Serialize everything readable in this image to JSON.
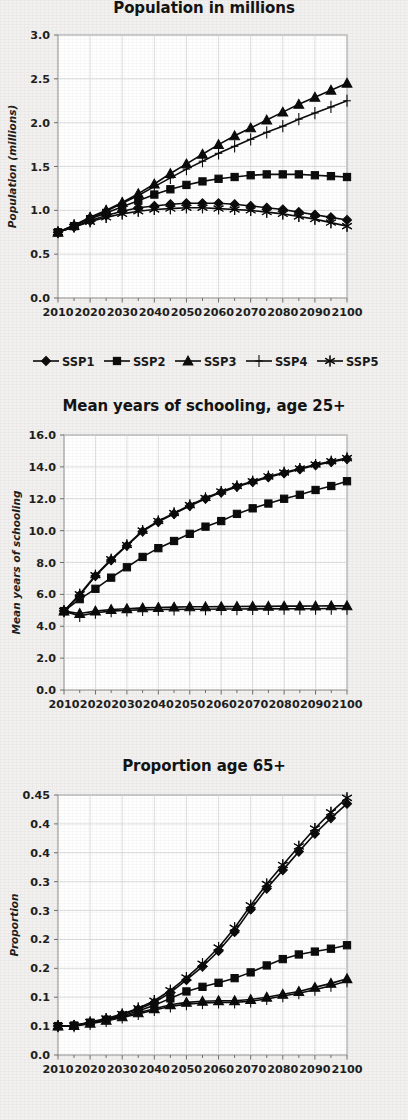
{
  "figure": {
    "background_color": "#f2f1ef",
    "ink_color": "#0c0c0c",
    "grid_color": "#d6d6d6",
    "plot_background": "#ffffff"
  },
  "legend": {
    "position": "below-first-chart",
    "entries": [
      {
        "label": "SSP1",
        "marker": "diamond"
      },
      {
        "label": "SSP2",
        "marker": "square"
      },
      {
        "label": "SSP3",
        "marker": "triangle"
      },
      {
        "label": "SSP4",
        "marker": "plus"
      },
      {
        "label": "SSP5",
        "marker": "asterisk"
      }
    ]
  },
  "chart_data": [
    {
      "type": "line",
      "title": "Population in millions",
      "xlabel": "",
      "ylabel": "Population (millions)",
      "x": [
        2010,
        2015,
        2020,
        2025,
        2030,
        2035,
        2040,
        2045,
        2050,
        2055,
        2060,
        2065,
        2070,
        2075,
        2080,
        2085,
        2090,
        2095,
        2100
      ],
      "xtick_labels": [
        "2010",
        "2020",
        "2030",
        "2040",
        "2050",
        "2060",
        "2070",
        "2080",
        "2090",
        "2100"
      ],
      "xlim": [
        2010,
        2100
      ],
      "ylim": [
        0.0,
        3.0
      ],
      "ytick_labels": [
        "0.0",
        "0.5",
        "1.0",
        "1.5",
        "2.0",
        "2.5",
        "3.0"
      ],
      "ytick_values": [
        0.0,
        0.5,
        1.0,
        1.5,
        2.0,
        2.5,
        3.0
      ],
      "grid": true,
      "legend_position": "bottom",
      "series": [
        {
          "name": "SSP1",
          "marker": "diamond",
          "values": [
            0.75,
            0.81,
            0.88,
            0.94,
            0.99,
            1.03,
            1.05,
            1.07,
            1.08,
            1.08,
            1.08,
            1.07,
            1.05,
            1.03,
            1.01,
            0.98,
            0.95,
            0.92,
            0.89
          ]
        },
        {
          "name": "SSP2",
          "marker": "square",
          "values": [
            0.75,
            0.82,
            0.9,
            0.97,
            1.04,
            1.11,
            1.18,
            1.24,
            1.29,
            1.33,
            1.36,
            1.38,
            1.4,
            1.41,
            1.41,
            1.41,
            1.4,
            1.39,
            1.38
          ]
        },
        {
          "name": "SSP3",
          "marker": "triangle",
          "values": [
            0.75,
            0.83,
            0.92,
            1.0,
            1.09,
            1.19,
            1.3,
            1.42,
            1.53,
            1.64,
            1.75,
            1.85,
            1.94,
            2.03,
            2.12,
            2.21,
            2.29,
            2.37,
            2.45
          ]
        },
        {
          "name": "SSP4",
          "marker": "plus",
          "values": [
            0.75,
            0.83,
            0.91,
            0.99,
            1.08,
            1.17,
            1.27,
            1.37,
            1.47,
            1.56,
            1.65,
            1.73,
            1.81,
            1.89,
            1.96,
            2.04,
            2.11,
            2.18,
            2.25
          ]
        },
        {
          "name": "SSP5",
          "marker": "asterisk",
          "values": [
            0.75,
            0.81,
            0.87,
            0.92,
            0.96,
            0.99,
            1.01,
            1.02,
            1.03,
            1.03,
            1.02,
            1.01,
            1.0,
            0.98,
            0.96,
            0.93,
            0.9,
            0.86,
            0.82
          ]
        }
      ]
    },
    {
      "type": "line",
      "title": "Mean years of schooling, age 25+",
      "xlabel": "",
      "ylabel": "Mean years of schooling",
      "x": [
        2010,
        2015,
        2020,
        2025,
        2030,
        2035,
        2040,
        2045,
        2050,
        2055,
        2060,
        2065,
        2070,
        2075,
        2080,
        2085,
        2090,
        2095,
        2100
      ],
      "xtick_labels": [
        "2010",
        "2020",
        "2030",
        "2040",
        "2050",
        "2060",
        "2070",
        "2080",
        "2090",
        "2100"
      ],
      "xlim": [
        2010,
        2100
      ],
      "ylim": [
        0.0,
        16.0
      ],
      "ytick_labels": [
        "0.0",
        "2.0",
        "4.0",
        "6.0",
        "8.0",
        "10.0",
        "12.0",
        "14.0",
        "16.0"
      ],
      "ytick_values": [
        0,
        2,
        4,
        6,
        8,
        10,
        12,
        14,
        16
      ],
      "grid": true,
      "series": [
        {
          "name": "SSP1",
          "marker": "diamond",
          "values": [
            4.95,
            5.95,
            7.15,
            8.15,
            9.05,
            9.95,
            10.55,
            11.05,
            11.55,
            12.0,
            12.4,
            12.75,
            13.05,
            13.35,
            13.6,
            13.85,
            14.1,
            14.3,
            14.5
          ]
        },
        {
          "name": "SSP2",
          "marker": "square",
          "values": [
            4.95,
            5.7,
            6.35,
            7.05,
            7.7,
            8.35,
            8.9,
            9.35,
            9.8,
            10.25,
            10.6,
            11.05,
            11.4,
            11.7,
            12.0,
            12.25,
            12.55,
            12.8,
            13.1
          ]
        },
        {
          "name": "SSP3",
          "marker": "triangle",
          "values": [
            4.95,
            4.8,
            4.95,
            5.05,
            5.1,
            5.15,
            5.18,
            5.2,
            5.22,
            5.22,
            5.23,
            5.24,
            5.25,
            5.25,
            5.26,
            5.26,
            5.27,
            5.28,
            5.28
          ]
        },
        {
          "name": "SSP4",
          "marker": "plus",
          "values": [
            4.95,
            4.65,
            4.85,
            4.95,
            5.0,
            5.03,
            5.05,
            5.06,
            5.07,
            5.07,
            5.08,
            5.08,
            5.09,
            5.09,
            5.1,
            5.1,
            5.1,
            5.11,
            5.11
          ]
        },
        {
          "name": "SSP5",
          "marker": "asterisk",
          "values": [
            4.95,
            6.0,
            7.2,
            8.2,
            9.1,
            10.0,
            10.6,
            11.1,
            11.6,
            12.05,
            12.45,
            12.8,
            13.1,
            13.4,
            13.65,
            13.9,
            14.15,
            14.35,
            14.55
          ]
        }
      ]
    },
    {
      "type": "line",
      "title": "Proportion age 65+",
      "xlabel": "",
      "ylabel": "Proportion",
      "x": [
        2010,
        2015,
        2020,
        2025,
        2030,
        2035,
        2040,
        2045,
        2050,
        2055,
        2060,
        2065,
        2070,
        2075,
        2080,
        2085,
        2090,
        2095,
        2100
      ],
      "xtick_labels": [
        "2010",
        "2020",
        "2030",
        "2040",
        "2050",
        "2060",
        "2070",
        "2080",
        "2090",
        "2100"
      ],
      "xlim": [
        2010,
        2100
      ],
      "ylim": [
        0.0,
        0.45
      ],
      "ytick_labels": [
        "0.0",
        "0.1",
        "0.1",
        "0.2",
        "0.2",
        "0.3",
        "0.3",
        "0.4",
        "0.4"
      ],
      "ytick_values": [
        0.0,
        0.05,
        0.1,
        0.15,
        0.2,
        0.25,
        0.3,
        0.35,
        0.4,
        0.45
      ],
      "grid": true,
      "series": [
        {
          "name": "SSP1",
          "marker": "diamond",
          "values": [
            0.05,
            0.051,
            0.056,
            0.062,
            0.07,
            0.079,
            0.091,
            0.108,
            0.13,
            0.153,
            0.18,
            0.213,
            0.252,
            0.288,
            0.32,
            0.352,
            0.383,
            0.41,
            0.435
          ]
        },
        {
          "name": "SSP2",
          "marker": "square",
          "values": [
            0.05,
            0.051,
            0.056,
            0.061,
            0.068,
            0.076,
            0.086,
            0.098,
            0.11,
            0.118,
            0.125,
            0.133,
            0.143,
            0.155,
            0.166,
            0.174,
            0.179,
            0.184,
            0.19
          ]
        },
        {
          "name": "SSP3",
          "marker": "triangle",
          "values": [
            0.05,
            0.051,
            0.055,
            0.06,
            0.066,
            0.073,
            0.08,
            0.087,
            0.091,
            0.093,
            0.094,
            0.094,
            0.096,
            0.1,
            0.105,
            0.11,
            0.117,
            0.124,
            0.132
          ]
        },
        {
          "name": "SSP4",
          "marker": "plus",
          "values": [
            0.05,
            0.05,
            0.054,
            0.059,
            0.065,
            0.071,
            0.078,
            0.084,
            0.088,
            0.09,
            0.091,
            0.091,
            0.093,
            0.097,
            0.102,
            0.107,
            0.113,
            0.12,
            0.128
          ]
        },
        {
          "name": "SSP5",
          "marker": "asterisk",
          "values": [
            0.05,
            0.051,
            0.057,
            0.063,
            0.071,
            0.081,
            0.094,
            0.112,
            0.134,
            0.158,
            0.186,
            0.22,
            0.259,
            0.296,
            0.329,
            0.361,
            0.392,
            0.42,
            0.445
          ]
        }
      ]
    }
  ]
}
